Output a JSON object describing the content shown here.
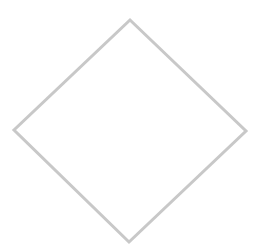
{
  "diagram": {
    "type": "flowchart-shape",
    "shapes": [
      {
        "kind": "diamond",
        "role": "decision-node",
        "label": "",
        "vertices": {
          "top": [
            130,
            20
          ],
          "right": [
            246,
            131
          ],
          "bottom": [
            129,
            242
          ],
          "left": [
            14,
            130
          ]
        },
        "stroke_color": "#c8c8c8",
        "stroke_width": 3,
        "fill_color": "#ffffff"
      }
    ]
  },
  "canvas": {
    "width": 265,
    "height": 251,
    "background": "#ffffff"
  }
}
